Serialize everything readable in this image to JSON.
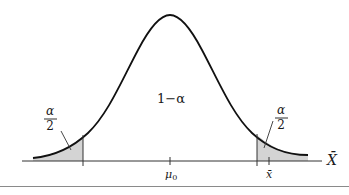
{
  "diagram": {
    "type": "normal-distribution-two-tailed-test",
    "center_label": "1−α",
    "left_tail_label": {
      "numerator": "α",
      "denominator": "2"
    },
    "right_tail_label": {
      "numerator": "α",
      "denominator": "2"
    },
    "axis_label": "X̄",
    "ticks": [
      {
        "name": "mu0",
        "label": "μ",
        "subscript": "0"
      },
      {
        "name": "xbar",
        "label": "x̄"
      }
    ],
    "colors": {
      "curve": "#111111",
      "axis": "#333333",
      "tail_fill": "#d4d4d4",
      "bottom_rule": "#8a8a8a"
    }
  }
}
